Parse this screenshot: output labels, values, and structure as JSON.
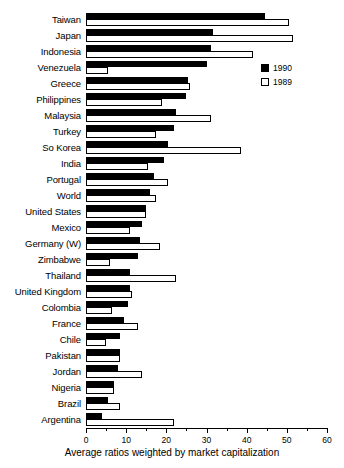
{
  "chart_data": {
    "type": "bar",
    "orientation": "horizontal",
    "title": "",
    "xlabel": "Average ratios weighted by market capitalization",
    "ylabel": "",
    "xlim": [
      0,
      60
    ],
    "xticks": [
      0,
      10,
      20,
      30,
      40,
      50,
      60
    ],
    "xminorticks": [
      5,
      15,
      25,
      35,
      45,
      55
    ],
    "grid": false,
    "legend_position": "upper right",
    "categories": [
      "Taiwan",
      "Japan",
      "Indonesia",
      "Venezuela",
      "Greece",
      "Philippines",
      "Malaysia",
      "Turkey",
      "So Korea",
      "India",
      "Portugal",
      "World",
      "United States",
      "Mexico",
      "Germany (W)",
      "Zimbabwe",
      "Thailand",
      "United Kingdom",
      "Colombia",
      "France",
      "Chile",
      "Pakistan",
      "Jordan",
      "Nigeria",
      "Brazil",
      "Argentina"
    ],
    "series": [
      {
        "name": "1990",
        "color": "#000000",
        "values": [
          44.5,
          31.5,
          31.0,
          30.0,
          25.5,
          25.0,
          22.5,
          22.0,
          20.5,
          19.5,
          17.0,
          16.0,
          15.0,
          14.0,
          13.5,
          13.0,
          11.0,
          11.0,
          10.5,
          9.5,
          8.5,
          8.5,
          8.0,
          7.0,
          5.5,
          4.0
        ]
      },
      {
        "name": "1989",
        "color": "#ffffff",
        "values": [
          50.5,
          51.5,
          41.5,
          5.5,
          26.0,
          19.0,
          31.0,
          17.5,
          38.5,
          15.5,
          20.5,
          17.5,
          15.0,
          11.0,
          18.5,
          6.0,
          22.5,
          11.5,
          6.5,
          13.0,
          5.0,
          8.5,
          14.0,
          7.0,
          8.5,
          22.0
        ]
      }
    ]
  },
  "legend": {
    "items": [
      {
        "label": "1990",
        "style": "filled"
      },
      {
        "label": "1989",
        "style": "hollow"
      }
    ]
  }
}
